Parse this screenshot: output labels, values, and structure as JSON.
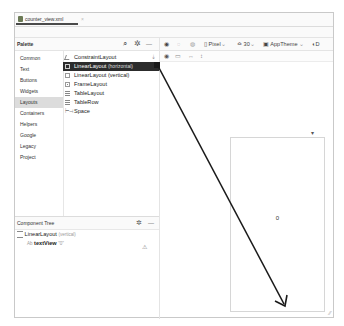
{
  "editor_tab": {
    "label": "counter_view.xml",
    "close": "×"
  },
  "palette": {
    "title": "Palette",
    "icons": {
      "search": "⌕",
      "settings": "✲",
      "minimize": "—"
    },
    "categories": [
      {
        "label": "Common"
      },
      {
        "label": "Text"
      },
      {
        "label": "Buttons"
      },
      {
        "label": "Widgets"
      },
      {
        "label": "Layouts",
        "selected": true
      },
      {
        "label": "Containers"
      },
      {
        "label": "Helpers"
      },
      {
        "label": "Google"
      },
      {
        "label": "Legacy"
      },
      {
        "label": "Project"
      }
    ],
    "items": [
      {
        "label": "ConstraintLayout",
        "sub": ""
      },
      {
        "label": "LinearLayout",
        "sub": "(horizontal)",
        "selected": true
      },
      {
        "label": "LinearLayout",
        "sub": "(vertical)"
      },
      {
        "label": "FrameLayout",
        "sub": ""
      },
      {
        "label": "TableLayout",
        "sub": ""
      },
      {
        "label": "TableRow",
        "sub": ""
      },
      {
        "label": "Space",
        "sub": ""
      }
    ]
  },
  "toolbar": {
    "device": "Pixel",
    "api": "30",
    "theme": "AppTheme",
    "chevron": "⌄"
  },
  "component_tree": {
    "title": "Component Tree",
    "root": {
      "label": "LinearLayout",
      "sub": "(vertical)"
    },
    "child": {
      "prefix": "Ab",
      "label": "textView",
      "value": "\"0\""
    },
    "warning": "⚠"
  },
  "design": {
    "text_value": "0"
  },
  "annotation": {
    "arrow_color": "#1a1a1a",
    "from": [
      158,
      66
    ],
    "to": [
      285,
      306
    ]
  }
}
